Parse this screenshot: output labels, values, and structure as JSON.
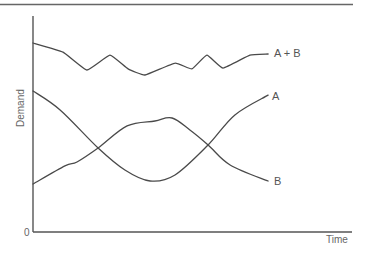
{
  "chart_data": {
    "type": "line",
    "title": "",
    "xlabel": "Time",
    "ylabel": "Demand",
    "y_tick_labels": [
      "0"
    ],
    "x_tick_labels": [],
    "xlim": [
      0,
      100
    ],
    "ylim": [
      0,
      100
    ],
    "grid": false,
    "legend": "inline labels at line ends",
    "series": [
      {
        "name": "A + B",
        "label": "A + B",
        "x": [
          0,
          9.4,
          16.9,
          24.1,
          29.8,
          35.1,
          44.5,
          49.8,
          54.5,
          59.6,
          68.0,
          73.7
        ],
        "values": [
          87.5,
          83.3,
          75.0,
          81.9,
          75.5,
          72.7,
          78.2,
          75.5,
          81.9,
          75.9,
          81.9,
          82.4
        ]
      },
      {
        "name": "A",
        "label": "A",
        "x": [
          0,
          10.0,
          13.8,
          20.4,
          29.5,
          38.2,
          43.6,
          49.2,
          54.9,
          61.8,
          73.7
        ],
        "values": [
          22.2,
          30.6,
          32.4,
          38.9,
          49.1,
          51.4,
          52.8,
          47.2,
          40.3,
          31.0,
          23.6
        ]
      },
      {
        "name": "B",
        "label": "B",
        "x": [
          0,
          8.5,
          20.4,
          28.8,
          36.7,
          44.5,
          54.9,
          63.3,
          73.7
        ],
        "values": [
          65.3,
          56.5,
          38.9,
          28.7,
          23.6,
          26.4,
          40.3,
          54.2,
          63.4
        ]
      }
    ],
    "note": "Labels A and B are attached to the right-hand ends of the crossing curves: the curve ending high is labelled A, the curve ending low is labelled B."
  },
  "labels": {
    "y_axis": "Demand",
    "x_axis": "Time",
    "origin": "0",
    "sum_curve": "A + B",
    "curve_high_end": "A",
    "curve_low_end": "B"
  }
}
